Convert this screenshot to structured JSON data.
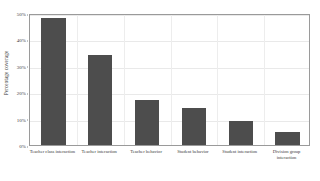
{
  "chart_data": {
    "type": "bar",
    "title": "",
    "xlabel": "",
    "ylabel": "Percentage coverage",
    "categories": [
      "Teacher class interaction",
      "Teacher interaction",
      "Teacher behavior",
      "Student behavior",
      "Student interaction",
      "Division group interaction"
    ],
    "values": [
      48,
      34,
      17,
      14,
      9,
      5
    ],
    "ylim": [
      0,
      50
    ],
    "ytick_labels": [
      "0%",
      "10%",
      "20%",
      "30%",
      "40%",
      "50%"
    ],
    "ytick_values": [
      0,
      10,
      20,
      30,
      40,
      50
    ],
    "grid": true,
    "legend": "none",
    "bar_color": "#4d4d4d",
    "frame_color": "#9a9a9a",
    "gridline_color": "#e9e9e9",
    "background_color": "#ffffff"
  }
}
